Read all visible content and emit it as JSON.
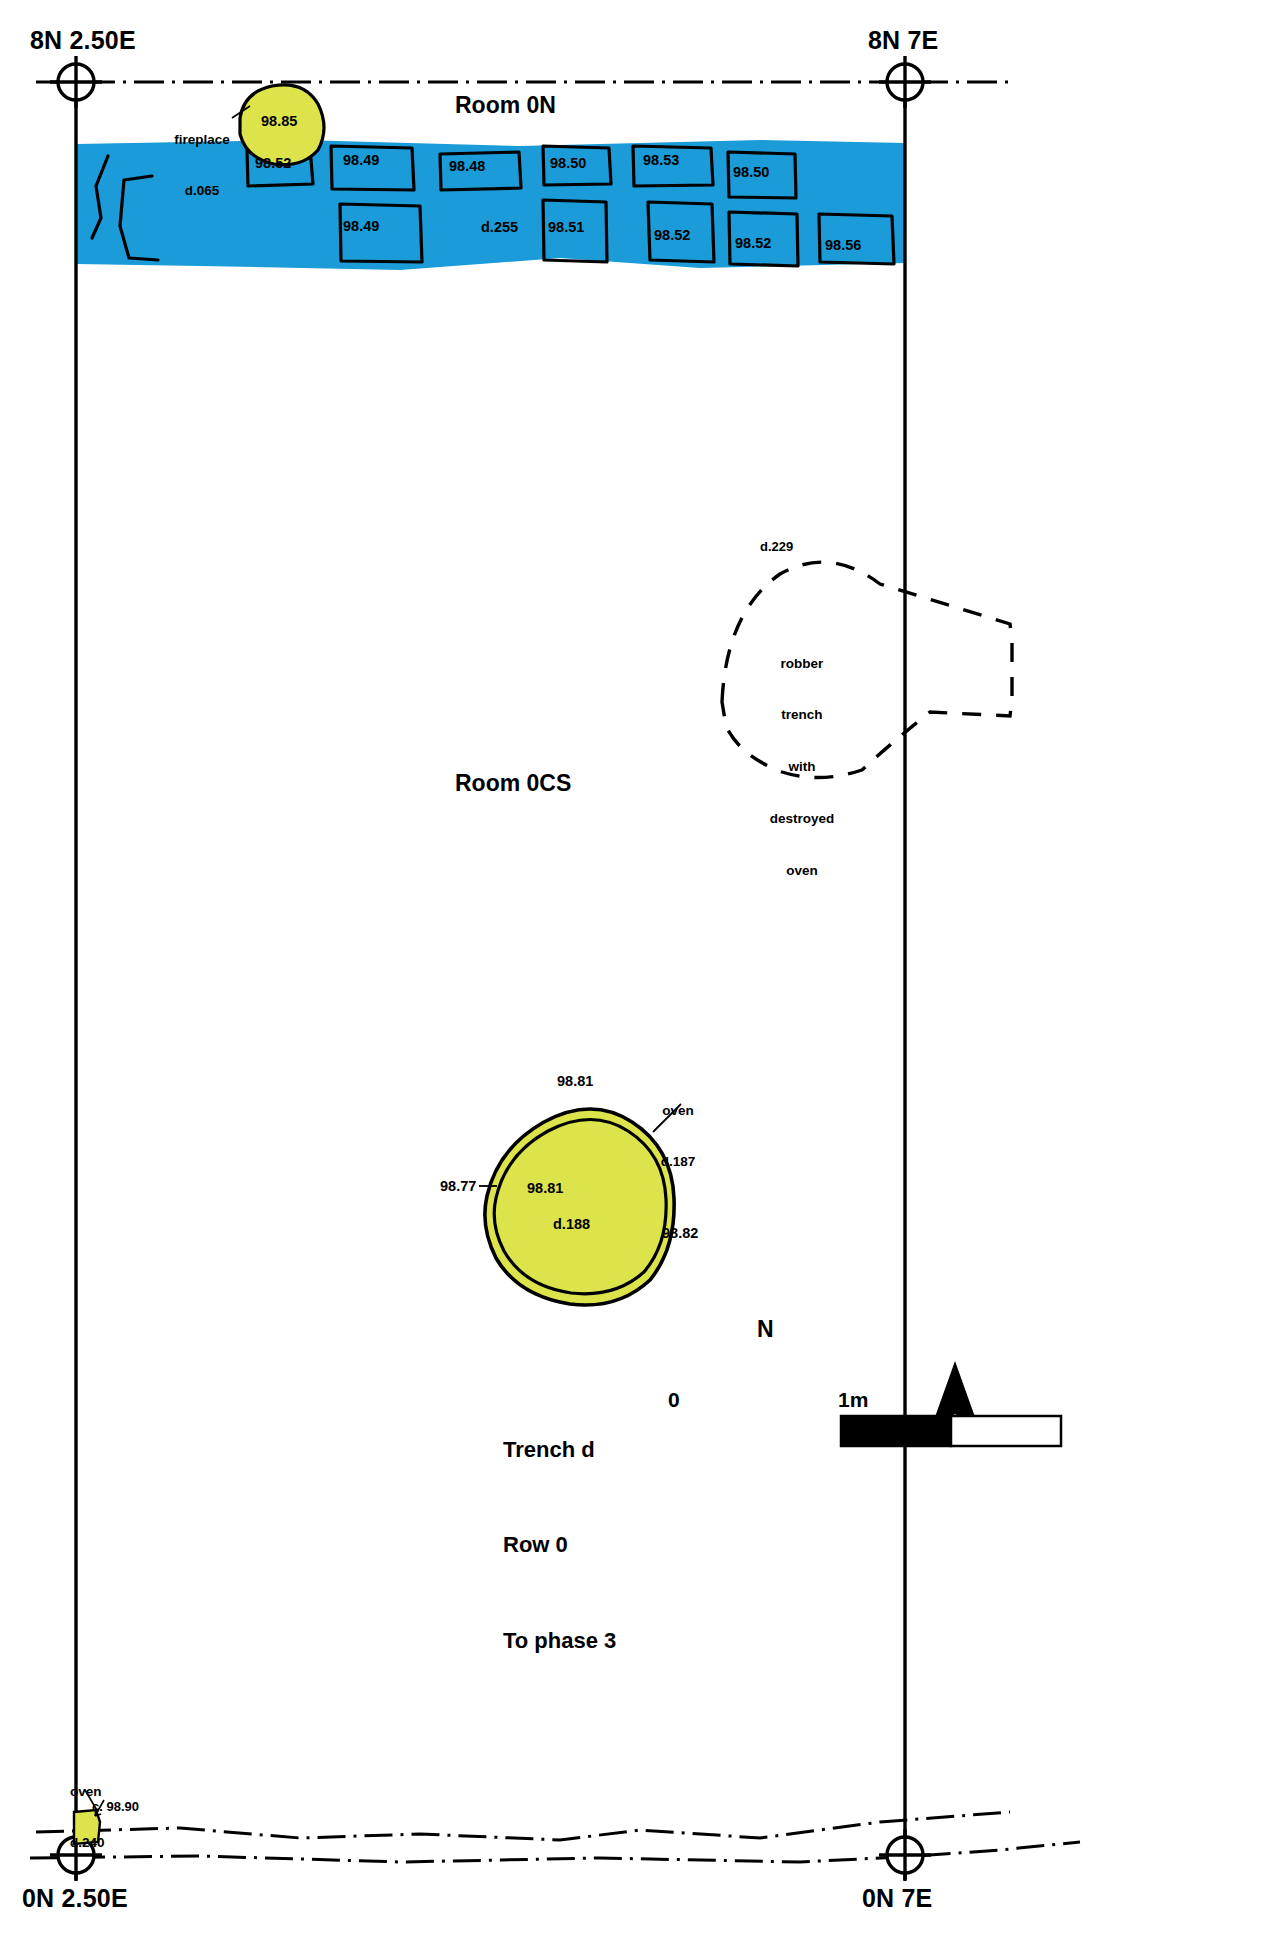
{
  "plan": {
    "title_block": {
      "line1": "Trench d",
      "line2": "Row 0",
      "line3": "To phase 3"
    },
    "scale_bar": {
      "start_label": "0",
      "end_label": "1m"
    },
    "north_arrow": {
      "label": "N"
    },
    "grid_corners": [
      {
        "name": "top-left",
        "label": "8N 2.50E"
      },
      {
        "name": "top-right",
        "label": "8N 7E"
      },
      {
        "name": "bottom-left",
        "label": "0N 2.50E"
      },
      {
        "name": "bottom-right",
        "label": "0N 7E"
      }
    ],
    "rooms": [
      {
        "label": "Room 0N"
      },
      {
        "label": "Room 0CS"
      }
    ],
    "features": {
      "fireplace": {
        "name_line1": "fireplace",
        "name_line2": "d.065",
        "elevation": "98.85"
      },
      "robber_trench": {
        "context": "d.229",
        "note_line1": "robber",
        "note_line2": "trench",
        "note_line3": "with",
        "note_line4": "destroyed",
        "note_line5": "oven"
      },
      "oven_main": {
        "name_line1": "oven",
        "name_line2": "d.187",
        "inner_context": "d.188",
        "elev_top": "98.81",
        "elev_centre": "98.81",
        "elev_left": "98.77",
        "elev_right": "98.82"
      },
      "oven_sw": {
        "name_line1": "oven",
        "name_line2": "d.240",
        "elevation": "c. 98.90"
      }
    },
    "stone_elevations": [
      {
        "id": "s1",
        "value": "98.52"
      },
      {
        "id": "s2",
        "value": "98.49"
      },
      {
        "id": "s3",
        "value": "98.48"
      },
      {
        "id": "s4",
        "value": "98.50"
      },
      {
        "id": "s5",
        "value": "98.53"
      },
      {
        "id": "s6",
        "value": "98.50"
      },
      {
        "id": "s7",
        "value": "98.49"
      },
      {
        "id": "s8",
        "value": "d.255"
      },
      {
        "id": "s9",
        "value": "98.51"
      },
      {
        "id": "s10",
        "value": "98.52"
      },
      {
        "id": "s11",
        "value": "98.52"
      },
      {
        "id": "s12",
        "value": "98.56"
      }
    ],
    "colors": {
      "paving_fill": "#1b9bd8",
      "burnt_feature_fill": "#dde34b",
      "line": "#000000",
      "background": "#ffffff"
    }
  }
}
